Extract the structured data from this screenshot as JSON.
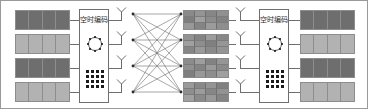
{
  "figure": {
    "width": 368,
    "height": 109,
    "border_color": "#9a9a9a",
    "background": "#ffffff"
  },
  "palette": {
    "dark_block": "#6e6e6e",
    "light_block": "#b2b2b2",
    "symbol_block": "#8f8f8f",
    "line": "#6f6f6f",
    "dot": "#1a1a1a",
    "text": "#2a2a2a"
  },
  "transmitter": {
    "name": "transmitter",
    "data_streams": {
      "label": "input data streams",
      "count": 4,
      "columns": 4,
      "blocks": [
        {
          "index": 0,
          "shade": "dark",
          "color": "#6e6e6e"
        },
        {
          "index": 1,
          "shade": "light",
          "color": "#b2b2b2"
        },
        {
          "index": 2,
          "shade": "dark",
          "color": "#6e6e6e"
        },
        {
          "index": 3,
          "shade": "light",
          "color": "#b2b2b2"
        }
      ]
    },
    "coder": {
      "label": "空时编码",
      "constellation_psk": {
        "name": "8-psk-constellation",
        "points": 8
      },
      "constellation_qam": {
        "name": "16-qam-constellation",
        "rows": 4,
        "cols": 4,
        "points": 16
      }
    },
    "antennas": {
      "label": "transmit antennas",
      "count": 4
    }
  },
  "channel": {
    "name": "mimo-channel",
    "label": "MIMO fading channel",
    "tx_nodes": 4,
    "rx_nodes": 4,
    "paths": 16
  },
  "coded_symbols": {
    "label": "space-time coded symbol matrices",
    "count": 4,
    "columns": 4,
    "rows": 3,
    "color": "#8f8f8f"
  },
  "receiver": {
    "name": "receiver",
    "antennas": {
      "label": "receive antennas",
      "count": 4
    },
    "decoder": {
      "label": "空时编码",
      "constellation_psk": {
        "name": "8-psk-constellation",
        "points": 8
      },
      "constellation_qam": {
        "name": "16-qam-constellation",
        "rows": 4,
        "cols": 4,
        "points": 16
      }
    },
    "data_streams": {
      "label": "output data streams",
      "count": 4,
      "columns": 4,
      "blocks": [
        {
          "index": 0,
          "shade": "dark",
          "color": "#6e6e6e"
        },
        {
          "index": 1,
          "shade": "light",
          "color": "#b2b2b2"
        },
        {
          "index": 2,
          "shade": "dark",
          "color": "#6e6e6e"
        },
        {
          "index": 3,
          "shade": "light",
          "color": "#b2b2b2"
        }
      ]
    }
  }
}
